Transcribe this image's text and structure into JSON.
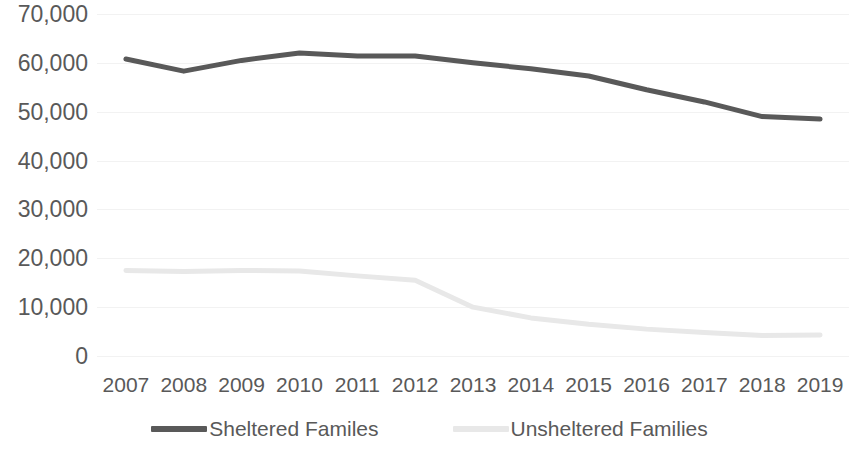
{
  "chart_data": {
    "type": "line",
    "title": "",
    "subtitle": "",
    "xlabel": "",
    "ylabel": "",
    "grid": true,
    "legend_position": "bottom",
    "categories": [
      "2007",
      "2008",
      "2009",
      "2010",
      "2011",
      "2012",
      "2013",
      "2014",
      "2015",
      "2016",
      "2017",
      "2018",
      "2019"
    ],
    "x_tick_labels": [
      "2007",
      "2008",
      "2009",
      "2010",
      "2011",
      "2012",
      "2013",
      "2014",
      "2015",
      "2016",
      "2017",
      "2018",
      "2019"
    ],
    "y_tick_labels": [
      "70,000",
      "60,000",
      "50,000",
      "40,000",
      "30,000",
      "20,000",
      "10,000",
      "0"
    ],
    "y_tick_values": [
      70000,
      60000,
      50000,
      40000,
      30000,
      20000,
      10000,
      0
    ],
    "ylim": [
      0,
      70000
    ],
    "series": [
      {
        "name": "Sheltered Familes",
        "color": "#595959",
        "values": [
          60800,
          58300,
          60500,
          62000,
          61400,
          61400,
          60000,
          58800,
          57300,
          54500,
          52000,
          49000,
          48500
        ]
      },
      {
        "name": "Unsheltered Families",
        "color": "#e8e8e8",
        "values": [
          17500,
          17300,
          17500,
          17400,
          16400,
          15500,
          10000,
          7800,
          6500,
          5500,
          4800,
          4200,
          4300
        ]
      }
    ]
  },
  "legend": {
    "items": [
      {
        "label": "Sheltered Familes",
        "color": "#595959"
      },
      {
        "label": "Unsheltered Families",
        "color": "#e8e8e8"
      }
    ]
  },
  "colors": {
    "sheltered": "#595959",
    "unsheltered": "#e8e8e8",
    "gridline": "#f2f2f2",
    "axis_text": "#595959",
    "background": "#ffffff"
  }
}
